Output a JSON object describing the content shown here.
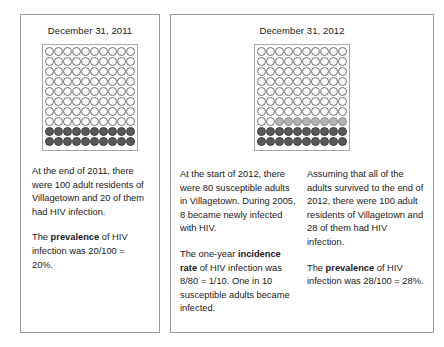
{
  "figure": {
    "type": "two-panel-dot-diagram",
    "background": "#ffffff",
    "panel_border_color": "#9a9a9a",
    "dot_colors": {
      "empty": "#ffffff",
      "newly_infected": "#b4b4b4",
      "infected": "#585858"
    }
  },
  "panels": [
    {
      "id": "panel-2011",
      "title": "December 31, 2011",
      "grid": {
        "rows": 10,
        "cols": 10,
        "total": 100,
        "empty_count": 80,
        "mid_count": 0,
        "dark_count": 20,
        "legend": {
          "empty": "susceptible adult",
          "dark": "adult with HIV infection"
        }
      },
      "columns": [
        {
          "paragraphs": [
            {
              "segments": [
                {
                  "text": "At the end of 2011, there were 100 adult residents of Villagetown and 20 of them had HIV infection.",
                  "bold": false
                }
              ]
            },
            {
              "segments": [
                {
                  "text": "The ",
                  "bold": false
                },
                {
                  "text": "prevalence",
                  "bold": true
                },
                {
                  "text": " of HIV infection was 20/100 = 20%.",
                  "bold": false
                }
              ]
            }
          ]
        }
      ]
    },
    {
      "id": "panel-2012",
      "title": "December 31, 2012",
      "grid": {
        "rows": 10,
        "cols": 10,
        "total": 100,
        "empty_count": 72,
        "mid_count": 8,
        "dark_count": 20,
        "legend": {
          "empty": "susceptible adult",
          "mid": "newly infected adult during 2012",
          "dark": "adult with HIV infection"
        }
      },
      "columns": [
        {
          "paragraphs": [
            {
              "segments": [
                {
                  "text": "At the start of 2012, there were 80 susceptible adults in Villagetown. During 2005, 8 became newly infected with HIV.",
                  "bold": false
                }
              ]
            },
            {
              "segments": [
                {
                  "text": "The one-year ",
                  "bold": false
                },
                {
                  "text": "incidence rate",
                  "bold": true
                },
                {
                  "text": " of HIV infection was 8/80 = 1/10. One in 10 susceptible adults became infected.",
                  "bold": false
                }
              ]
            }
          ]
        },
        {
          "paragraphs": [
            {
              "segments": [
                {
                  "text": "Assuming that all of the adults survived to the end of 2012, there were 100 adult residents of Villagetown and 28 of them had HIV infection.",
                  "bold": false
                }
              ]
            },
            {
              "segments": [
                {
                  "text": "The ",
                  "bold": false
                },
                {
                  "text": "prevalence",
                  "bold": true
                },
                {
                  "text": " of HIV infection was 28/100 = 28%.",
                  "bold": false
                }
              ]
            }
          ]
        }
      ]
    }
  ]
}
